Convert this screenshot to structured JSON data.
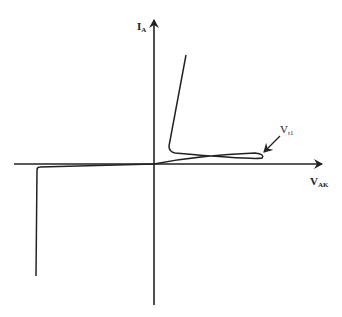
{
  "diagram": {
    "y_axis": {
      "label": "I",
      "subscript": "A"
    },
    "x_axis": {
      "label": "V",
      "subscript": "AK"
    },
    "annotation": {
      "label": "V",
      "subscript": "t1"
    },
    "colors": {
      "line": "#222222",
      "background": "#ffffff"
    }
  }
}
